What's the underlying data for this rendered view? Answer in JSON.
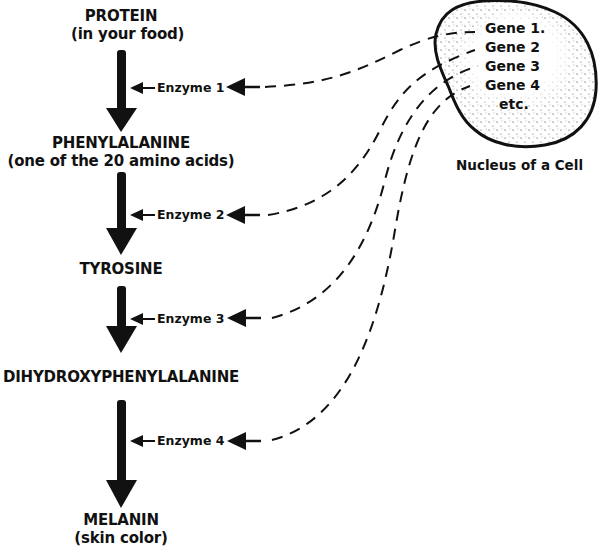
{
  "diagram": {
    "steps": [
      {
        "name": "PROTEIN",
        "detail": "(in your food)"
      },
      {
        "name": "PHENYLALANINE",
        "detail": "(one of the 20 amino acids)"
      },
      {
        "name": "TYROSINE",
        "detail": ""
      },
      {
        "name": "DIHYDROXYPHENYLALANINE",
        "detail": ""
      },
      {
        "name": "MELANIN",
        "detail": "(skin color)"
      }
    ],
    "enzymes": [
      "Enzyme 1",
      "Enzyme 2",
      "Enzyme 3",
      "Enzyme 4"
    ],
    "nucleus": {
      "genes": [
        "Gene 1.",
        "Gene 2",
        "Gene 3",
        "Gene 4",
        "etc."
      ],
      "caption": "Nucleus of a Cell"
    },
    "colors": {
      "ink": "#111111",
      "background": "#ffffff"
    }
  }
}
